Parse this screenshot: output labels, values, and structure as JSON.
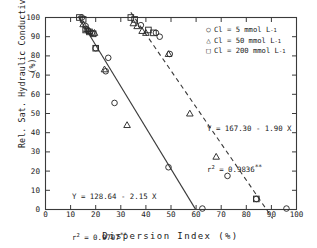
{
  "chart_data": {
    "type": "scatter",
    "title": "",
    "xlabel": "Dispersion Index (%)",
    "ylabel": "Rel. Sat. Hydraulic Conductivity (%)",
    "xlim": [
      0,
      100
    ],
    "ylim": [
      0,
      100
    ],
    "xticks": [
      0,
      10,
      20,
      30,
      40,
      50,
      60,
      70,
      80,
      90,
      100
    ],
    "yticks": [
      0,
      10,
      20,
      30,
      40,
      50,
      60,
      70,
      80,
      90,
      100
    ],
    "grid": false,
    "legend_position": "top-right",
    "series": [
      {
        "name": "Cl = 5 mmol L-1",
        "marker": "circle",
        "points": [
          [
            14.5,
            100.0
          ],
          [
            16.0,
            95.5
          ],
          [
            17.0,
            93.0
          ],
          [
            18.5,
            92.0
          ],
          [
            20.0,
            84.0
          ],
          [
            25.0,
            79.0
          ],
          [
            24.0,
            72.0
          ],
          [
            27.5,
            55.5
          ],
          [
            49.0,
            22.0
          ],
          [
            62.5,
            0.5
          ],
          [
            38.0,
            96.0
          ],
          [
            44.0,
            92.0
          ],
          [
            45.5,
            90.0
          ],
          [
            49.5,
            81.0
          ],
          [
            72.5,
            17.5
          ],
          [
            84.0,
            5.5
          ],
          [
            96.0,
            0.5
          ]
        ]
      },
      {
        "name": "Cl = 50 mmol L-1",
        "marker": "triangle",
        "points": [
          [
            15.0,
            96.5
          ],
          [
            16.5,
            94.0
          ],
          [
            17.5,
            93.0
          ],
          [
            19.5,
            92.0
          ],
          [
            23.5,
            73.0
          ],
          [
            32.5,
            44.0
          ],
          [
            35.0,
            97.0
          ],
          [
            36.5,
            95.5
          ],
          [
            38.5,
            93.0
          ],
          [
            40.0,
            92.0
          ],
          [
            49.0,
            81.0
          ],
          [
            57.5,
            50.0
          ],
          [
            68.0,
            27.5
          ]
        ]
      },
      {
        "name": "Cl = 200 mmol L-1",
        "marker": "square",
        "points": [
          [
            13.5,
            100.0
          ],
          [
            15.0,
            99.0
          ],
          [
            16.0,
            93.5
          ],
          [
            17.5,
            92.5
          ],
          [
            19.0,
            91.5
          ],
          [
            20.0,
            84.0
          ],
          [
            34.0,
            100.0
          ],
          [
            35.5,
            99.0
          ],
          [
            41.0,
            93.5
          ],
          [
            43.0,
            92.0
          ],
          [
            84.0,
            5.5
          ]
        ]
      }
    ],
    "fits": [
      {
        "name": "solid-regression-left",
        "style": "solid",
        "equation": "Y = 128.64 - 2.15 X",
        "intercept": 128.64,
        "slope": -2.15,
        "r2_label": "r",
        "r2_exp": "2",
        "r2_value": "= 0.9707",
        "significance": "**",
        "x_from": 13.0,
        "x_to": 59.8
      },
      {
        "name": "dashed-regression-right",
        "style": "dashed",
        "equation": "Y = 167.30 - 1.90 X",
        "intercept": 167.3,
        "slope": -1.9,
        "r2_label": "r",
        "r2_exp": "2",
        "r2_value": "= 0.9836",
        "significance": "**",
        "x_from": 34.0,
        "x_to": 90.5
      }
    ]
  },
  "legend": {
    "items": [
      {
        "marker": "○",
        "text": "Cl = 5 mmol L"
      },
      {
        "marker": "△",
        "text": "Cl = 50 mmol L"
      },
      {
        "marker": "□",
        "text": "Cl = 200 mmol L"
      }
    ],
    "unit_exp": "-1"
  },
  "annotations": {
    "right": {
      "line1": "Y = 167.30 - 1.90 X",
      "r": "r",
      "exp": "2",
      "rest": "= 0.9836",
      "star": "**"
    },
    "left": {
      "line1": "Y = 128.64 - 2.15 X",
      "r": "r",
      "exp": "2",
      "rest": "= 0.9707",
      "star": "**"
    }
  }
}
